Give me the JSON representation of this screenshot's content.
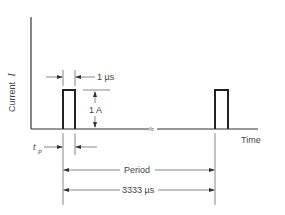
{
  "diagram": {
    "y_axis_label": "Current",
    "y_axis_symbol": "I",
    "x_axis_label": "Time",
    "pulse_width_label": "1 µs",
    "amplitude_label": "1 A",
    "tp_label": "t",
    "tp_subscript": "p",
    "period_label": "Period",
    "period_value_label": "3333 µs",
    "break_symbol": "≈",
    "colors": {
      "background": "#ffffff",
      "ink": "#333333"
    }
  }
}
